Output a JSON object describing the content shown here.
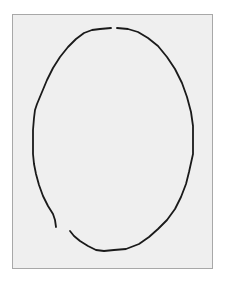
{
  "figure": {
    "background_color": "#efefef",
    "border_color": "#a8a8a8",
    "stroke_color": "#1a1a1a",
    "shape": "hand-drawn-ellipse-contour",
    "ellipse": {
      "cx": 113,
      "cy": 140,
      "rx": 80,
      "ry": 112
    },
    "gaps": [
      {
        "position": "top",
        "approx_x": 114,
        "approx_y": 28
      },
      {
        "position": "bottom-left",
        "from": [
          56,
          227
        ],
        "to": [
          70,
          231
        ]
      }
    ]
  }
}
